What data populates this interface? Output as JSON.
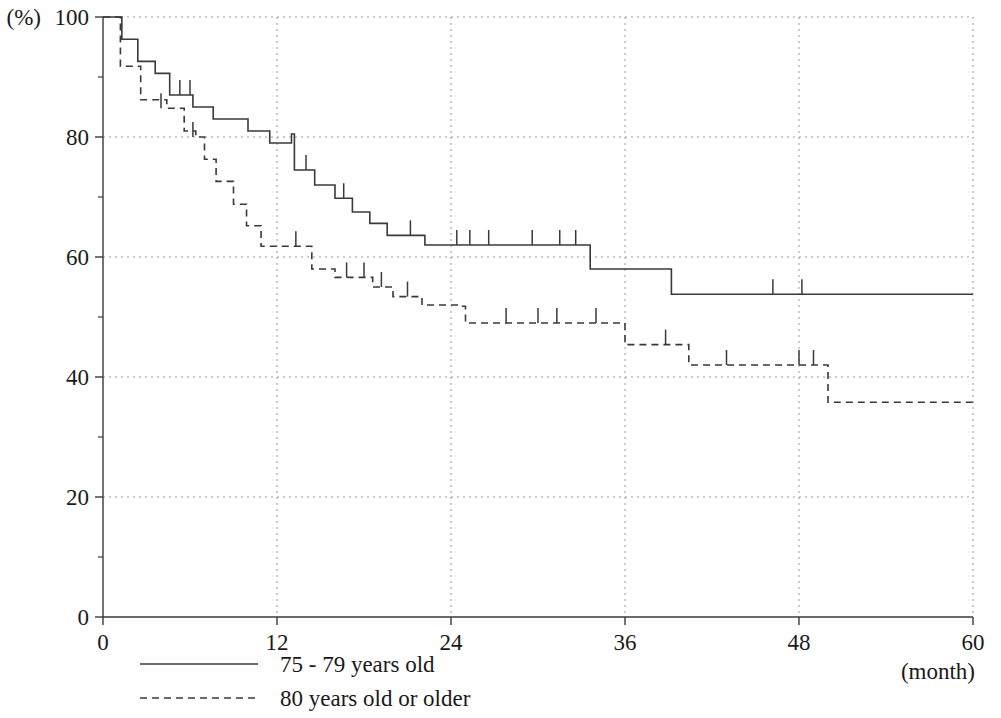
{
  "chart_data": {
    "type": "line",
    "title": "",
    "subtitle": "",
    "xlabel": "(month)",
    "ylabel": "(%)",
    "xlim": [
      0,
      60
    ],
    "ylim": [
      0,
      100
    ],
    "xticks": [
      0,
      12,
      24,
      36,
      48,
      60
    ],
    "xtick_labels": [
      "0",
      "12",
      "24",
      "36",
      "48",
      "60"
    ],
    "yticks": [
      0,
      20,
      40,
      60,
      80,
      100
    ],
    "ytick_labels": [
      "0",
      "20",
      "40",
      "60",
      "80",
      "100"
    ],
    "y_minor_ticks": [
      10,
      30,
      50,
      70,
      90
    ],
    "grid": true,
    "grid_style": "dotted",
    "legend_position": "below-axes-left",
    "curve_style": "kaplan-meier-step",
    "series": [
      {
        "name": "75 - 79 years old",
        "line_style": "solid",
        "color": "#3a3a3a",
        "steps": [
          [
            0.0,
            100.0
          ],
          [
            1.3,
            96.3
          ],
          [
            2.4,
            92.6
          ],
          [
            3.6,
            90.6
          ],
          [
            4.6,
            87.0
          ],
          [
            6.2,
            85.0
          ],
          [
            7.6,
            83.0
          ],
          [
            10.0,
            81.0
          ],
          [
            11.5,
            79.0
          ],
          [
            13.0,
            80.5
          ],
          [
            13.2,
            74.5
          ],
          [
            14.6,
            72.0
          ],
          [
            16.0,
            69.8
          ],
          [
            17.2,
            67.5
          ],
          [
            18.4,
            65.6
          ],
          [
            19.6,
            63.6
          ],
          [
            22.2,
            62.0
          ],
          [
            33.6,
            58.0
          ],
          [
            39.2,
            53.8
          ],
          [
            60.0,
            53.8
          ]
        ],
        "censor_marks": [
          [
            5.3,
            87.0
          ],
          [
            6.0,
            87.0
          ],
          [
            14.0,
            74.5
          ],
          [
            16.6,
            69.8
          ],
          [
            21.2,
            63.6
          ],
          [
            24.4,
            62.0
          ],
          [
            25.3,
            62.0
          ],
          [
            26.6,
            62.0
          ],
          [
            29.6,
            62.0
          ],
          [
            31.5,
            62.0
          ],
          [
            32.6,
            62.0
          ],
          [
            46.2,
            53.8
          ],
          [
            48.2,
            53.8
          ]
        ]
      },
      {
        "name": "80 years old or older",
        "line_style": "dashed",
        "color": "#3a3a3a",
        "steps": [
          [
            0.0,
            100.0
          ],
          [
            1.2,
            91.8
          ],
          [
            2.6,
            86.2
          ],
          [
            4.4,
            84.8
          ],
          [
            5.6,
            81.0
          ],
          [
            6.4,
            80.0
          ],
          [
            7.0,
            76.3
          ],
          [
            7.8,
            72.6
          ],
          [
            9.0,
            68.8
          ],
          [
            9.9,
            65.2
          ],
          [
            10.9,
            61.8
          ],
          [
            14.2,
            61.8
          ],
          [
            14.4,
            58.0
          ],
          [
            16.0,
            56.6
          ],
          [
            18.6,
            55.0
          ],
          [
            20.0,
            53.4
          ],
          [
            22.0,
            52.0
          ],
          [
            24.6,
            51.8
          ],
          [
            25.0,
            49.0
          ],
          [
            35.8,
            49.0
          ],
          [
            36.0,
            45.4
          ],
          [
            40.0,
            45.4
          ],
          [
            40.4,
            42.0
          ],
          [
            49.6,
            42.0
          ],
          [
            50.0,
            35.8
          ],
          [
            60.0,
            35.8
          ]
        ],
        "censor_marks": [
          [
            4.0,
            84.8
          ],
          [
            6.2,
            80.0
          ],
          [
            13.3,
            61.8
          ],
          [
            16.8,
            56.6
          ],
          [
            18.0,
            56.6
          ],
          [
            19.2,
            55.0
          ],
          [
            21.0,
            53.4
          ],
          [
            27.8,
            49.0
          ],
          [
            30.0,
            49.0
          ],
          [
            31.3,
            49.0
          ],
          [
            34.0,
            49.0
          ],
          [
            38.8,
            45.4
          ],
          [
            43.0,
            42.0
          ],
          [
            48.0,
            42.0
          ],
          [
            49.0,
            42.0
          ]
        ]
      }
    ],
    "legend": [
      {
        "label": "75 - 79 years old",
        "line_style": "solid"
      },
      {
        "label": "80 years old or older",
        "line_style": "dashed"
      }
    ]
  },
  "axes": {
    "y_axis_unit": "(%)",
    "x_axis_unit": "(month)"
  }
}
